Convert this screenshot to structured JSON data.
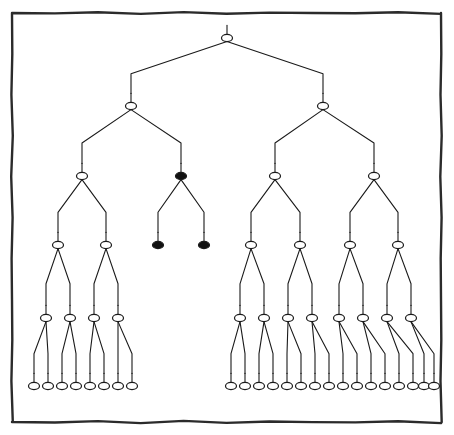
{
  "figure": {
    "canvas": {
      "width": 454,
      "height": 435
    },
    "background_color": "#ffffff",
    "line_color": "#1a1a1a",
    "node_fill_open": "#ffffff",
    "node_fill_filled": "#111111",
    "node_stroke": "#1a1a1a"
  },
  "frame": {
    "label": "hand-drawn rectangular border",
    "x": 12,
    "y": 13,
    "width": 429,
    "height": 409,
    "stroke_width": 2.4,
    "color": "#2b2b2b"
  },
  "chart_data": {
    "type": "diagram",
    "diagram_kind": "binary-tree",
    "node_shape": "ellipse",
    "node_rx": 5.5,
    "node_ry": 3.6,
    "stem_length": 9,
    "levels": [
      {
        "level": 0,
        "y": 38,
        "count": 1
      },
      {
        "level": 1,
        "y": 106,
        "count": 2
      },
      {
        "level": 2,
        "y": 176,
        "count": 4
      },
      {
        "level": 3,
        "y": 245,
        "count": 8
      },
      {
        "level": 4,
        "y": 318,
        "count": 12
      },
      {
        "level": 5,
        "y": 386,
        "count": 24
      }
    ],
    "fill_states": [
      "open",
      "filled"
    ],
    "legend": [],
    "counts": {
      "total_nodes": 51,
      "filled_nodes": 3,
      "open_nodes": 48,
      "leaves": 26
    },
    "nodes": [
      {
        "id": "r",
        "level": 0,
        "x": 227,
        "y": 38,
        "fill": "open",
        "parent": null
      },
      {
        "id": "a",
        "level": 1,
        "x": 131,
        "y": 106,
        "fill": "open",
        "parent": "r"
      },
      {
        "id": "b",
        "level": 1,
        "x": 323,
        "y": 106,
        "fill": "open",
        "parent": "r"
      },
      {
        "id": "a1",
        "level": 2,
        "x": 82,
        "y": 176,
        "fill": "open",
        "parent": "a"
      },
      {
        "id": "a2",
        "level": 2,
        "x": 181,
        "y": 176,
        "fill": "filled",
        "parent": "a"
      },
      {
        "id": "b1",
        "level": 2,
        "x": 275,
        "y": 176,
        "fill": "open",
        "parent": "b"
      },
      {
        "id": "b2",
        "level": 2,
        "x": 374,
        "y": 176,
        "fill": "open",
        "parent": "b"
      },
      {
        "id": "a1a",
        "level": 3,
        "x": 58,
        "y": 245,
        "fill": "open",
        "parent": "a1"
      },
      {
        "id": "a1b",
        "level": 3,
        "x": 106,
        "y": 245,
        "fill": "open",
        "parent": "a1"
      },
      {
        "id": "a2a",
        "level": 3,
        "x": 158,
        "y": 245,
        "fill": "filled",
        "parent": "a2"
      },
      {
        "id": "a2b",
        "level": 3,
        "x": 204,
        "y": 245,
        "fill": "filled",
        "parent": "a2"
      },
      {
        "id": "b1a",
        "level": 3,
        "x": 251,
        "y": 245,
        "fill": "open",
        "parent": "b1"
      },
      {
        "id": "b1b",
        "level": 3,
        "x": 300,
        "y": 245,
        "fill": "open",
        "parent": "b1"
      },
      {
        "id": "b2a",
        "level": 3,
        "x": 350,
        "y": 245,
        "fill": "open",
        "parent": "b2"
      },
      {
        "id": "b2b",
        "level": 3,
        "x": 398,
        "y": 245,
        "fill": "open",
        "parent": "b2"
      },
      {
        "id": "n40",
        "level": 4,
        "x": 46,
        "y": 318,
        "fill": "open",
        "parent": "a1a"
      },
      {
        "id": "n41",
        "level": 4,
        "x": 70,
        "y": 318,
        "fill": "open",
        "parent": "a1a"
      },
      {
        "id": "n42",
        "level": 4,
        "x": 94,
        "y": 318,
        "fill": "open",
        "parent": "a1b"
      },
      {
        "id": "n43",
        "level": 4,
        "x": 118,
        "y": 318,
        "fill": "open",
        "parent": "a1b"
      },
      {
        "id": "n44",
        "level": 4,
        "x": 240,
        "y": 318,
        "fill": "open",
        "parent": "b1a"
      },
      {
        "id": "n45",
        "level": 4,
        "x": 264,
        "y": 318,
        "fill": "open",
        "parent": "b1a"
      },
      {
        "id": "n46",
        "level": 4,
        "x": 288,
        "y": 318,
        "fill": "open",
        "parent": "b1b"
      },
      {
        "id": "n47",
        "level": 4,
        "x": 312,
        "y": 318,
        "fill": "open",
        "parent": "b1b"
      },
      {
        "id": "n48",
        "level": 4,
        "x": 339,
        "y": 318,
        "fill": "open",
        "parent": "b2a"
      },
      {
        "id": "n49",
        "level": 4,
        "x": 363,
        "y": 318,
        "fill": "open",
        "parent": "b2a"
      },
      {
        "id": "n50",
        "level": 4,
        "x": 387,
        "y": 318,
        "fill": "open",
        "parent": "b2b"
      },
      {
        "id": "n51",
        "level": 4,
        "x": 411,
        "y": 318,
        "fill": "open",
        "parent": "b2b"
      },
      {
        "id": "l0",
        "level": 5,
        "x": 34,
        "y": 386,
        "fill": "open",
        "parent": "n40"
      },
      {
        "id": "l1",
        "level": 5,
        "x": 48,
        "y": 386,
        "fill": "open",
        "parent": "n40"
      },
      {
        "id": "l2",
        "level": 5,
        "x": 62,
        "y": 386,
        "fill": "open",
        "parent": "n41"
      },
      {
        "id": "l3",
        "level": 5,
        "x": 76,
        "y": 386,
        "fill": "open",
        "parent": "n41"
      },
      {
        "id": "l4",
        "level": 5,
        "x": 90,
        "y": 386,
        "fill": "open",
        "parent": "n42"
      },
      {
        "id": "l5",
        "level": 5,
        "x": 104,
        "y": 386,
        "fill": "open",
        "parent": "n42"
      },
      {
        "id": "l6",
        "level": 5,
        "x": 118,
        "y": 386,
        "fill": "open",
        "parent": "n43"
      },
      {
        "id": "l7",
        "level": 5,
        "x": 132,
        "y": 386,
        "fill": "open",
        "parent": "n43"
      },
      {
        "id": "l8",
        "level": 5,
        "x": 231,
        "y": 386,
        "fill": "open",
        "parent": "n44"
      },
      {
        "id": "l9",
        "level": 5,
        "x": 245,
        "y": 386,
        "fill": "open",
        "parent": "n44"
      },
      {
        "id": "l10",
        "level": 5,
        "x": 259,
        "y": 386,
        "fill": "open",
        "parent": "n45"
      },
      {
        "id": "l11",
        "level": 5,
        "x": 273,
        "y": 386,
        "fill": "open",
        "parent": "n45"
      },
      {
        "id": "l12",
        "level": 5,
        "x": 287,
        "y": 386,
        "fill": "open",
        "parent": "n46"
      },
      {
        "id": "l13",
        "level": 5,
        "x": 301,
        "y": 386,
        "fill": "open",
        "parent": "n46"
      },
      {
        "id": "l14",
        "level": 5,
        "x": 315,
        "y": 386,
        "fill": "open",
        "parent": "n47"
      },
      {
        "id": "l15",
        "level": 5,
        "x": 329,
        "y": 386,
        "fill": "open",
        "parent": "n47"
      },
      {
        "id": "l16",
        "level": 5,
        "x": 343,
        "y": 386,
        "fill": "open",
        "parent": "n48"
      },
      {
        "id": "l17",
        "level": 5,
        "x": 357,
        "y": 386,
        "fill": "open",
        "parent": "n48"
      },
      {
        "id": "l18",
        "level": 5,
        "x": 371,
        "y": 386,
        "fill": "open",
        "parent": "n49"
      },
      {
        "id": "l19",
        "level": 5,
        "x": 385,
        "y": 386,
        "fill": "open",
        "parent": "n49"
      },
      {
        "id": "l20",
        "level": 5,
        "x": 399,
        "y": 386,
        "fill": "open",
        "parent": "n50"
      },
      {
        "id": "l21",
        "level": 5,
        "x": 413,
        "y": 386,
        "fill": "open",
        "parent": "n50"
      },
      {
        "id": "l22",
        "level": 5,
        "x": 424,
        "y": 386,
        "fill": "open",
        "parent": "n51"
      },
      {
        "id": "l23",
        "level": 5,
        "x": 434,
        "y": 386,
        "fill": "open",
        "parent": "n51"
      }
    ]
  }
}
